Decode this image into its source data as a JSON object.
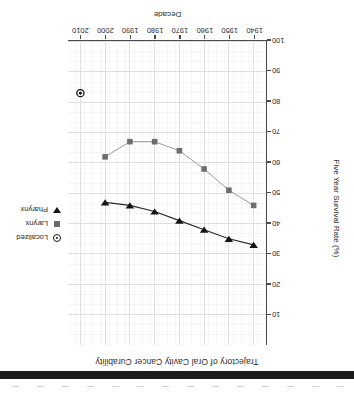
{
  "chart_data": {
    "type": "line",
    "title": "Trajectory of Oral Cavity Cancer Curability",
    "xlabel": "Decade",
    "ylabel": "Five Year Survival Rate (%)",
    "xlim": [
      1935,
      2015
    ],
    "ylim": [
      0,
      100
    ],
    "x_ticks": [
      1940,
      1950,
      1960,
      1970,
      1980,
      1990,
      2000,
      2010
    ],
    "y_ticks": [
      10,
      20,
      30,
      40,
      50,
      60,
      70,
      80,
      90,
      100
    ],
    "y_axis_inverted": true,
    "grid": true,
    "minor_grid": true,
    "legend_position": "upper-right-inside",
    "x": [
      1940,
      1950,
      1960,
      1970,
      1980,
      1990,
      2000,
      2010
    ],
    "series": [
      {
        "name": "Pharynx",
        "marker": "triangle-down",
        "color": "#141414",
        "x": [
          1940,
          1950,
          1960,
          1970,
          1980,
          1990,
          2000
        ],
        "values": [
          33,
          35,
          38,
          41,
          44,
          46,
          47
        ]
      },
      {
        "name": "Larynx",
        "marker": "square",
        "color": "#6d6d6d",
        "x": [
          1940,
          1950,
          1960,
          1970,
          1980,
          1990,
          2000
        ],
        "values": [
          46,
          51,
          58,
          64,
          67,
          67,
          62
        ]
      },
      {
        "name": "Localized",
        "marker": "circle-dot",
        "color": "#141414",
        "x": [
          2010
        ],
        "values": [
          83
        ]
      }
    ]
  },
  "chart": {
    "title": "Trajectory of Oral Cavity Cancer Curability",
    "x_axis_title": "Decade",
    "y_axis_title": "Five Year Survival Rate (%)"
  },
  "legend": {
    "items": [
      {
        "label": "Localized",
        "marker": "circle-dot-icon"
      },
      {
        "label": "Larynx",
        "marker": "square-icon"
      },
      {
        "label": "Pharynx",
        "marker": "triangle-down-icon"
      }
    ]
  }
}
